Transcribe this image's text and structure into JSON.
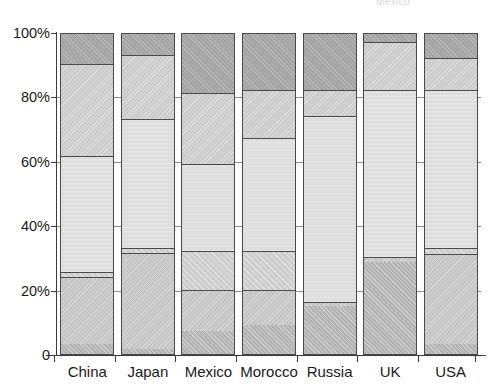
{
  "chart_title": "Mexico",
  "axis": {
    "y_ticks": [
      "0",
      "20%",
      "40%",
      "60%",
      "80%",
      "100%"
    ],
    "y_tick_values": [
      0,
      20,
      40,
      60,
      80,
      100
    ],
    "y_min": 0,
    "y_max": 100
  },
  "legend": {
    "series_names": [
      "Series 1",
      "Series 2",
      "Series 3",
      "Series 4",
      "Series 5",
      "Series 6"
    ],
    "visible": false
  },
  "chart_data": {
    "type": "bar",
    "stacked": true,
    "normalized_percent": true,
    "title": "Mexico",
    "xlabel": "",
    "ylabel": "",
    "ylim": [
      0,
      100
    ],
    "grid": true,
    "legend_position": "none",
    "categories": [
      "China",
      "Japan",
      "Mexico",
      "Morocco",
      "Russia",
      "UK",
      "USA"
    ],
    "series": [
      {
        "name": "Series 1",
        "color": "#b2b2b2",
        "values": [
          3,
          1.5,
          7,
          9,
          15,
          28.5,
          3
        ]
      },
      {
        "name": "Series 2",
        "color": "#c4c4c4",
        "values": [
          21,
          30,
          13,
          11,
          1,
          1.5,
          28
        ]
      },
      {
        "name": "Series 3",
        "color": "#cdcdcd",
        "values": [
          1.5,
          1.5,
          12,
          12,
          0,
          0,
          2
        ]
      },
      {
        "name": "Series 4",
        "color": "#dedede",
        "values": [
          36,
          40,
          27,
          35,
          58,
          52,
          49
        ]
      },
      {
        "name": "Series 5",
        "color": "#cacaca",
        "values": [
          28.5,
          20,
          22,
          15,
          8,
          15,
          10
        ]
      },
      {
        "name": "Series 6",
        "color": "#a3a3a3",
        "values": [
          10,
          7,
          19,
          18,
          18,
          3,
          8
        ]
      }
    ],
    "stack_boundaries_percent": {
      "China": [
        0,
        3,
        24,
        25.5,
        61.5,
        90,
        100
      ],
      "Japan": [
        0,
        1.5,
        31.5,
        33,
        73,
        93,
        100
      ],
      "Mexico": [
        0,
        7,
        20,
        32,
        59,
        81,
        100
      ],
      "Morocco": [
        0,
        9,
        20,
        32,
        67,
        82,
        100
      ],
      "Russia": [
        0,
        15,
        16,
        16,
        74,
        82,
        100
      ],
      "UK": [
        0,
        28.5,
        30,
        30,
        82,
        97,
        100
      ],
      "USA": [
        0,
        3,
        31,
        33,
        82,
        92,
        100
      ]
    }
  }
}
